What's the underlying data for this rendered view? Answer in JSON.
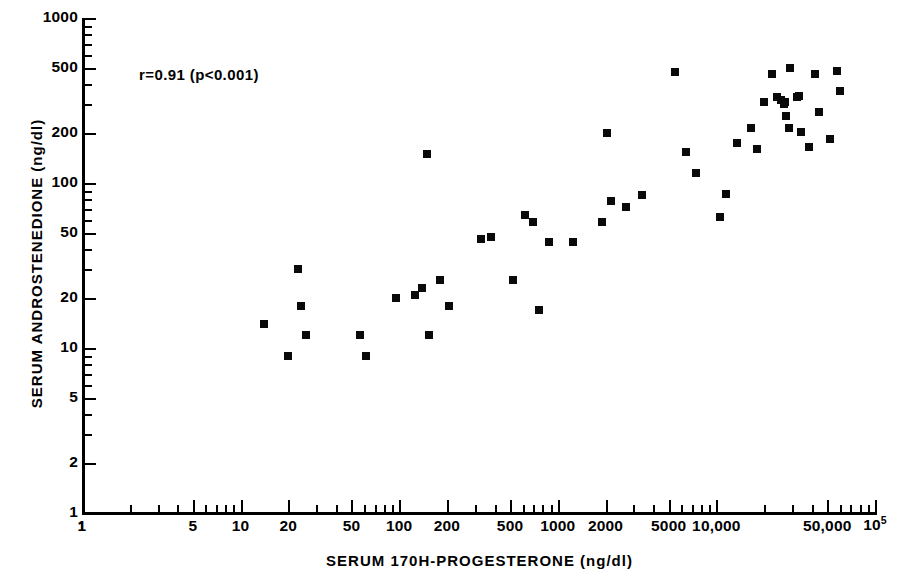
{
  "chart_data": {
    "type": "scatter",
    "title": "",
    "xlabel": "SERUM 170H-PROGESTERONE (ng/dl)",
    "ylabel": "SERUM ANDROSTENEDIONE (ng/dl)",
    "xscale": "log",
    "yscale": "log",
    "xlim": [
      1,
      100000
    ],
    "ylim": [
      1,
      1000
    ],
    "grid": false,
    "legend": null,
    "annotations": [
      {
        "text": "r=0.91 (p<0.001)",
        "x": 24,
        "y": 520
      }
    ],
    "statistics": {
      "r": 0.91,
      "p": "<0.001"
    },
    "xticks": [
      {
        "value": 1,
        "label": "1"
      },
      {
        "value": 5,
        "label": "5"
      },
      {
        "value": 10,
        "label": "10"
      },
      {
        "value": 20,
        "label": "20"
      },
      {
        "value": 50,
        "label": "50"
      },
      {
        "value": 100,
        "label": "100"
      },
      {
        "value": 200,
        "label": "200"
      },
      {
        "value": 500,
        "label": "500"
      },
      {
        "value": 1000,
        "label": "1000"
      },
      {
        "value": 2000,
        "label": "2000"
      },
      {
        "value": 5000,
        "label": "5000"
      },
      {
        "value": 10000,
        "label": "10,000"
      },
      {
        "value": 50000,
        "label": "50,000"
      },
      {
        "value": 100000,
        "label": "10^5"
      }
    ],
    "yticks": [
      {
        "value": 1000,
        "label": "1000"
      },
      {
        "value": 500,
        "label": "500"
      },
      {
        "value": 200,
        "label": "200"
      },
      {
        "value": 100,
        "label": "100"
      },
      {
        "value": 50,
        "label": "50"
      },
      {
        "value": 20,
        "label": "20"
      },
      {
        "value": 10,
        "label": "10"
      },
      {
        "value": 5,
        "label": "5"
      },
      {
        "value": 2,
        "label": "2"
      },
      {
        "value": 1,
        "label": "1"
      }
    ],
    "points": [
      {
        "x": 14,
        "y": 14
      },
      {
        "x": 20,
        "y": 9
      },
      {
        "x": 23,
        "y": 30
      },
      {
        "x": 24,
        "y": 18
      },
      {
        "x": 26,
        "y": 12
      },
      {
        "x": 57,
        "y": 12
      },
      {
        "x": 62,
        "y": 9
      },
      {
        "x": 95,
        "y": 20
      },
      {
        "x": 125,
        "y": 21
      },
      {
        "x": 140,
        "y": 23
      },
      {
        "x": 150,
        "y": 150
      },
      {
        "x": 155,
        "y": 12
      },
      {
        "x": 180,
        "y": 26
      },
      {
        "x": 205,
        "y": 18
      },
      {
        "x": 330,
        "y": 46
      },
      {
        "x": 380,
        "y": 47
      },
      {
        "x": 520,
        "y": 26
      },
      {
        "x": 620,
        "y": 64
      },
      {
        "x": 700,
        "y": 58
      },
      {
        "x": 760,
        "y": 17
      },
      {
        "x": 880,
        "y": 44
      },
      {
        "x": 1250,
        "y": 44
      },
      {
        "x": 1900,
        "y": 58
      },
      {
        "x": 2050,
        "y": 200
      },
      {
        "x": 2150,
        "y": 78
      },
      {
        "x": 2700,
        "y": 72
      },
      {
        "x": 3400,
        "y": 85
      },
      {
        "x": 5500,
        "y": 470
      },
      {
        "x": 6400,
        "y": 155
      },
      {
        "x": 7400,
        "y": 115
      },
      {
        "x": 10500,
        "y": 62
      },
      {
        "x": 11500,
        "y": 86
      },
      {
        "x": 13500,
        "y": 175
      },
      {
        "x": 16500,
        "y": 215
      },
      {
        "x": 18000,
        "y": 160
      },
      {
        "x": 20000,
        "y": 310
      },
      {
        "x": 22500,
        "y": 460
      },
      {
        "x": 24000,
        "y": 330
      },
      {
        "x": 25500,
        "y": 320
      },
      {
        "x": 26500,
        "y": 300
      },
      {
        "x": 27000,
        "y": 310
      },
      {
        "x": 27500,
        "y": 255
      },
      {
        "x": 28500,
        "y": 215
      },
      {
        "x": 29000,
        "y": 500
      },
      {
        "x": 32000,
        "y": 330
      },
      {
        "x": 33000,
        "y": 335
      },
      {
        "x": 34000,
        "y": 205
      },
      {
        "x": 38500,
        "y": 165
      },
      {
        "x": 42000,
        "y": 460
      },
      {
        "x": 44500,
        "y": 270
      },
      {
        "x": 52000,
        "y": 185
      },
      {
        "x": 58000,
        "y": 480
      },
      {
        "x": 60000,
        "y": 360
      }
    ]
  }
}
